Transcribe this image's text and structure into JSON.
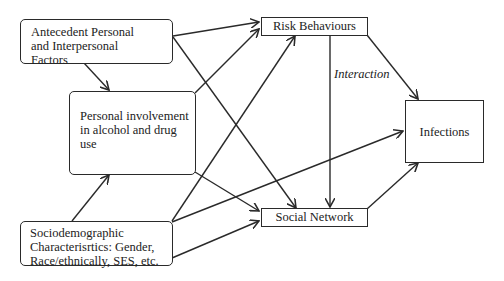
{
  "diagram": {
    "nodes": {
      "antecedent": {
        "label": "Antecedent Personal and Interpersonal Factors",
        "lines": [
          "Antecedent Personal",
          "and Interpersonal",
          "Factors"
        ]
      },
      "personal_involvement": {
        "label": "Personal involvement in alcohol and drug use",
        "lines": [
          "Personal involvement",
          "in alcohol and drug",
          "use"
        ]
      },
      "sociodemographic": {
        "label": "Sociodemographic Characterisrtics: Gender, Race/ethnically, SES, etc.",
        "lines": [
          "Sociodemographic",
          "Characterisrtics: Gender,",
          "Race/ethnically, SES, etc."
        ]
      },
      "risk_behaviours": {
        "label": "Risk Behaviours"
      },
      "social_network": {
        "label": "Social Network"
      },
      "infections": {
        "label": "Infections"
      }
    },
    "edge_labels": {
      "interaction": "Interaction"
    },
    "edges": [
      {
        "from": "antecedent",
        "to": "risk_behaviours"
      },
      {
        "from": "antecedent",
        "to": "social_network"
      },
      {
        "from": "antecedent",
        "to": "personal_involvement"
      },
      {
        "from": "personal_involvement",
        "to": "risk_behaviours"
      },
      {
        "from": "personal_involvement",
        "to": "social_network"
      },
      {
        "from": "sociodemographic",
        "to": "personal_involvement"
      },
      {
        "from": "sociodemographic",
        "to": "risk_behaviours"
      },
      {
        "from": "sociodemographic",
        "to": "social_network"
      },
      {
        "from": "sociodemographic",
        "to": "infections"
      },
      {
        "from": "risk_behaviours",
        "to": "social_network",
        "label": "Interaction"
      },
      {
        "from": "risk_behaviours",
        "to": "infections"
      },
      {
        "from": "social_network",
        "to": "infections"
      }
    ]
  }
}
